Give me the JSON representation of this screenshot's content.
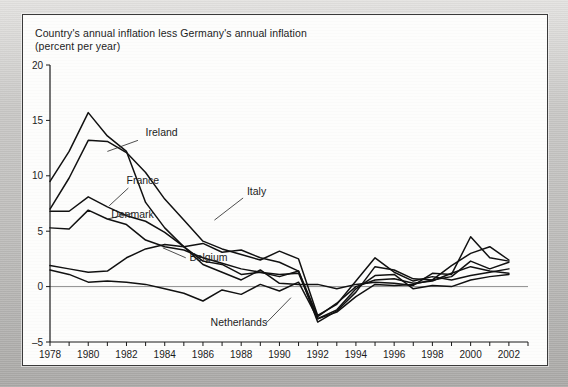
{
  "figure": {
    "title_line1": "Country's annual inflation less Germany's annual inflation",
    "title_line2": "(percent per year)"
  },
  "chart_data": {
    "type": "line",
    "title": "Country's annual inflation less Germany's annual inflation (percent per year)",
    "xlabel": "",
    "ylabel": "percent per year",
    "xlim": [
      1978,
      2003
    ],
    "ylim": [
      -5,
      20
    ],
    "yticks": [
      -5,
      0,
      5,
      10,
      15,
      20
    ],
    "ytick_labels": [
      "-5",
      "0",
      "5",
      "10",
      "15",
      "20"
    ],
    "xticks": [
      1978,
      1979,
      1980,
      1981,
      1982,
      1983,
      1984,
      1985,
      1986,
      1987,
      1988,
      1989,
      1990,
      1991,
      1992,
      1993,
      1994,
      1995,
      1996,
      1997,
      1998,
      1999,
      2000,
      2001,
      2002,
      2003
    ],
    "xtick_labels_shown": [
      "1978",
      "1980",
      "1982",
      "1984",
      "1986",
      "1988",
      "1990",
      "1992",
      "1994",
      "1996",
      "1998",
      "2000",
      "2002"
    ],
    "grid": false,
    "zero_line": true,
    "legend_position": "inline-annotations",
    "line_color": "#111111",
    "x": [
      1978,
      1979,
      1980,
      1981,
      1982,
      1983,
      1984,
      1985,
      1986,
      1987,
      1988,
      1989,
      1990,
      1991,
      1992,
      1993,
      1994,
      1995,
      1996,
      1997,
      1998,
      1999,
      2000,
      2001,
      2002
    ],
    "series": [
      {
        "name": "Ireland",
        "label_x": 1983.0,
        "label_y": 13.6,
        "values": [
          9.5,
          12.2,
          15.7,
          13.6,
          12.2,
          7.6,
          5.3,
          3.6,
          2.0,
          1.3,
          0.6,
          1.5,
          0.3,
          0.2,
          0.2,
          -0.2,
          0.2,
          0.4,
          0.3,
          0.1,
          1.2,
          1.1,
          4.5,
          2.6,
          2.3
        ]
      },
      {
        "name": "Italy",
        "label_x": 1988.3,
        "label_y": 8.3,
        "values": [
          7.0,
          9.8,
          13.2,
          13.1,
          12.1,
          10.3,
          7.9,
          6.0,
          4.1,
          3.4,
          2.9,
          2.4,
          3.2,
          2.5,
          -2.6,
          -1.6,
          0.5,
          2.6,
          1.3,
          0.5,
          0.9,
          0.6,
          1.0,
          1.3,
          1.6
        ]
      },
      {
        "name": "France",
        "label_x": 1982.0,
        "label_y": 9.3,
        "values": [
          6.8,
          6.8,
          8.1,
          7.2,
          6.4,
          5.9,
          4.9,
          3.6,
          2.3,
          2.0,
          1.1,
          1.3,
          1.1,
          1.2,
          -2.9,
          -2.1,
          -0.2,
          1.0,
          1.1,
          -0.2,
          0.1,
          0.0,
          0.6,
          0.9,
          1.1
        ]
      },
      {
        "name": "Denmark",
        "label_x": 1981.2,
        "label_y": 6.2,
        "values": [
          5.3,
          5.2,
          6.9,
          6.1,
          5.6,
          4.2,
          3.6,
          3.3,
          2.6,
          2.1,
          1.6,
          1.3,
          0.9,
          1.4,
          -2.7,
          -1.5,
          0.0,
          0.6,
          0.7,
          0.3,
          0.5,
          1.2,
          1.8,
          1.4,
          1.2
        ]
      },
      {
        "name": "Belgium",
        "label_x": 1985.3,
        "label_y": 2.3,
        "values": [
          1.9,
          1.6,
          1.3,
          1.4,
          2.6,
          3.4,
          3.8,
          3.6,
          3.9,
          3.1,
          3.3,
          2.6,
          2.2,
          1.4,
          -3.2,
          -2.2,
          -0.5,
          1.8,
          1.5,
          0.7,
          0.6,
          0.9,
          2.3,
          1.6,
          2.2
        ]
      },
      {
        "name": "Netherlands",
        "label_x": 1986.4,
        "label_y": -3.6,
        "values": [
          1.5,
          1.1,
          0.4,
          0.5,
          0.4,
          0.2,
          -0.2,
          -0.6,
          -1.3,
          -0.3,
          -0.7,
          0.2,
          -0.4,
          0.4,
          -2.9,
          -2.3,
          -0.9,
          0.2,
          0.1,
          0.2,
          0.6,
          1.9,
          3.0,
          3.6,
          2.4
        ]
      }
    ]
  }
}
